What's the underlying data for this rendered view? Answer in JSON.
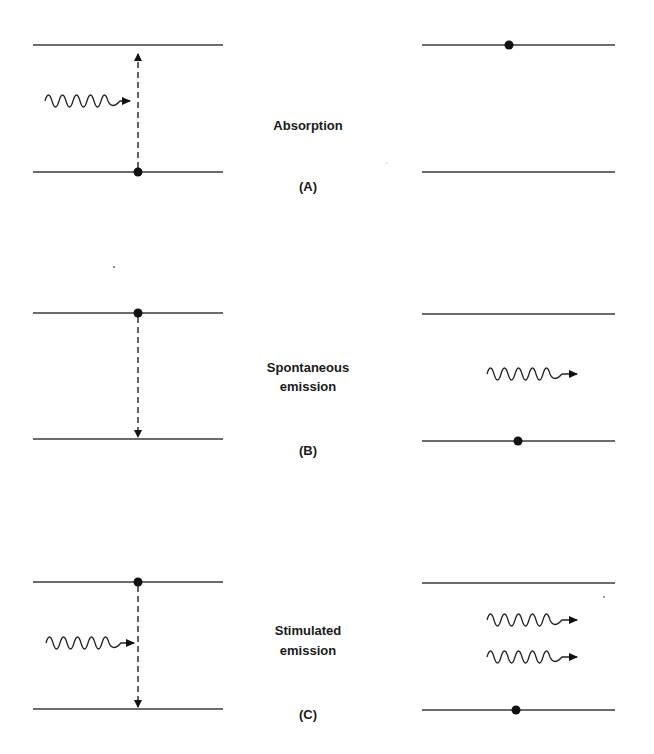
{
  "figure": {
    "panels": [
      {
        "id": "A",
        "label": "(A)",
        "title_lines": [
          "Absorption"
        ],
        "description": "Incoming photon excites electron from lower level to upper level"
      },
      {
        "id": "B",
        "label": "(B)",
        "title_lines": [
          "Spontaneous",
          "emission"
        ],
        "description": "Electron decays from upper to lower level emitting a photon"
      },
      {
        "id": "C",
        "label": "(C)",
        "title_lines": [
          "Stimulated",
          "emission"
        ],
        "description": "Incoming photon stimulates decay, two photons emitted"
      }
    ]
  },
  "colors": {
    "line": "#3a3a3a",
    "dot": "#111111",
    "text": "#1a1a1a",
    "background": "#ffffff"
  }
}
